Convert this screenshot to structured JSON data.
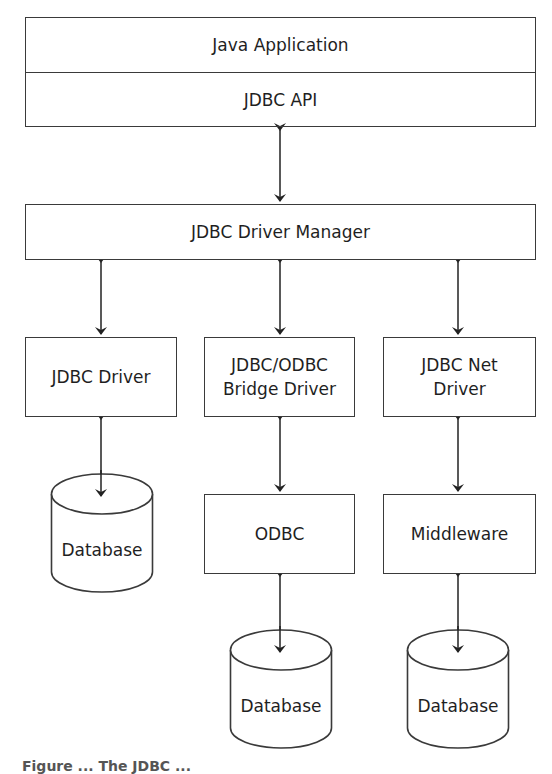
{
  "diagram": {
    "top_stack": {
      "app_label": "Java Application",
      "api_label": "JDBC API"
    },
    "manager_label": "JDBC Driver Manager",
    "drivers": [
      {
        "label_line1": "JDBC Driver",
        "label_line2": ""
      },
      {
        "label_line1": "JDBC/ODBC",
        "label_line2": "Bridge Driver"
      },
      {
        "label_line1": "JDBC Net",
        "label_line2": "Driver"
      }
    ],
    "intermediates": [
      {
        "label": "ODBC"
      },
      {
        "label": "Middleware"
      }
    ],
    "databases": [
      {
        "label": "Database"
      },
      {
        "label": "Database"
      },
      {
        "label": "Database"
      }
    ],
    "caption": "Figure ... The JDBC ..."
  },
  "colors": {
    "stroke": "#3a3a3a",
    "text": "#1f1f1f",
    "background": "#ffffff"
  }
}
